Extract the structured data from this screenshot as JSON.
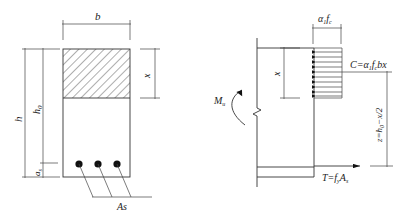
{
  "diagram": {
    "title": "",
    "cross_section": {
      "width_label": "b",
      "height_label": "h",
      "effective_depth_label": "h0",
      "cover_label": "as",
      "compression_depth_label": "x",
      "steel_area_label": "As",
      "rebar_count": 3
    },
    "force_diagram": {
      "moment_label": "Mu",
      "stress_label": "α1fc",
      "compression_depth_label": "x",
      "compression_force_label": "C=α1fcbx",
      "lever_arm_label": "z=h0−x/2",
      "tension_force_label": "T=fyAs"
    },
    "colors": {
      "line": "#333333",
      "background": "#ffffff",
      "rebar": "#111111"
    }
  }
}
